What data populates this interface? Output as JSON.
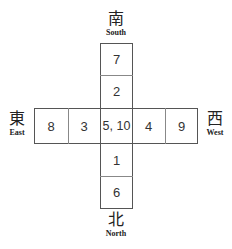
{
  "diagram": {
    "directions": {
      "south": {
        "chinese": "南",
        "english": "South"
      },
      "north": {
        "chinese": "北",
        "english": "North"
      },
      "east": {
        "chinese": "東",
        "english": "East"
      },
      "west": {
        "chinese": "西",
        "english": "West"
      }
    },
    "vertical_cells": {
      "top_outer": "7",
      "top_inner": "2",
      "bottom_inner": "1",
      "bottom_outer": "6"
    },
    "horizontal_cells": {
      "left_outer": "8",
      "left_inner": "3",
      "center": "5, 10",
      "right_inner": "4",
      "right_outer": "9"
    }
  }
}
